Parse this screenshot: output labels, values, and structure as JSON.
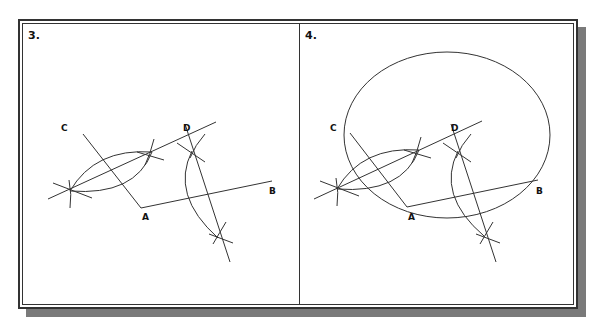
{
  "figure": {
    "panels": [
      {
        "step_label": "3.",
        "points": {
          "C": "C",
          "D": "D",
          "A": "A",
          "B": "B"
        },
        "description": "Perpendicular bisectors of AC and AB constructed with compass arcs"
      },
      {
        "step_label": "4.",
        "points": {
          "C": "C",
          "D": "D",
          "A": "A",
          "B": "B"
        },
        "description": "Circle drawn through points C, A, and B from the intersection of the bisectors"
      }
    ],
    "colors": {
      "line": "#333333",
      "shadow": "#7a7a7a",
      "background": "#ffffff"
    }
  }
}
